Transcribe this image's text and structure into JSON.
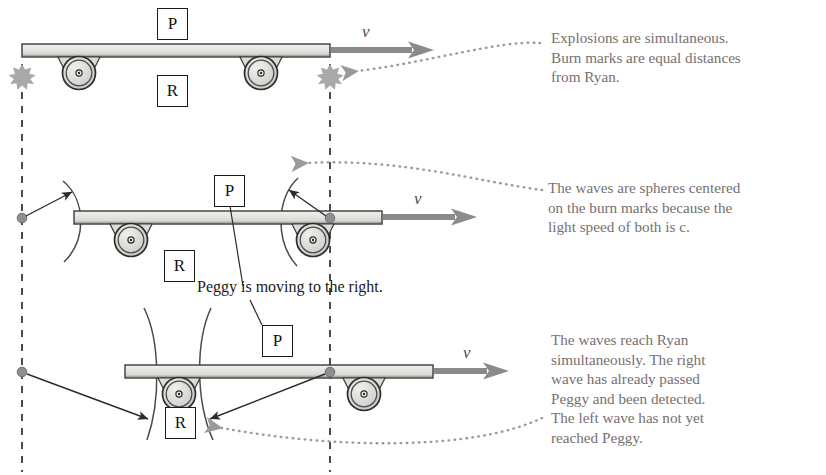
{
  "figure": {
    "title_caption": "Peggy is moving to the right.",
    "frame_labels": {
      "peggy": "P",
      "ryan": "R"
    },
    "velocity_symbol": "v"
  },
  "panels": [
    {
      "id": "panel-top",
      "frame_label_top": "P",
      "frame_label_bottom": "R",
      "velocity_symbol": "v",
      "note": "Explosions are simultaneous.\nBurn marks are equal distances\nfrom Ryan."
    },
    {
      "id": "panel-middle",
      "frame_label_top": "P",
      "frame_label_bottom": "R",
      "velocity_symbol": "v",
      "note": "The waves are spheres centered\non the burn marks because the\nlight speed of both is c."
    },
    {
      "id": "panel-bottom",
      "frame_label_top": "P",
      "frame_label_bottom": "R",
      "velocity_symbol": "v",
      "note": "The waves reach Ryan\nsimultaneously. The right\nwave has already passed\nPeggy and been detected.\nThe left wave has not yet\nreached Peggy."
    }
  ],
  "colors": {
    "note_text": "#777070",
    "caption_text": "#1a1a1a",
    "platform_fill": "#e2e2de",
    "platform_stroke": "#3a3a3a",
    "wheel_stroke": "#2c2c2c",
    "wheel_fill": "#d9d9d6",
    "dashed_line": "#2e2e2e",
    "velocity_arrow": "#8a8a8a",
    "burst": "#a9a9a9",
    "burn_dot": "#8f8f8f",
    "leader_dotted": "#9a9a9a",
    "wave_arc": "#4a4a4a"
  }
}
